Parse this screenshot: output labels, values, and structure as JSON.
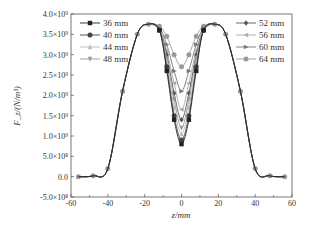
{
  "chart_data": {
    "type": "line",
    "title": "",
    "xlabel": "z/mm",
    "ylabel": "F_z/(N/m³)",
    "xlim": [
      -60,
      60
    ],
    "ylim": [
      -500000000,
      4000000000
    ],
    "grid": false,
    "legend_position": "upper-left and upper-right inside plot",
    "x_ticks": [
      "-60",
      "-40",
      "-20",
      "0",
      "20",
      "40",
      "60"
    ],
    "y_ticks": [
      "-5.0×10⁸",
      "0.0",
      "5.0×10⁸",
      "1.0×10⁹",
      "1.5×10⁹",
      "2.0×10⁹",
      "2.5×10⁹",
      "3.0×10⁹",
      "3.5×10⁹",
      "4.0×10⁹"
    ],
    "x": [
      -56,
      -48,
      -40,
      -32,
      -24,
      -18,
      -12,
      -8,
      -4,
      0,
      4,
      8,
      12,
      18,
      24,
      32,
      40,
      48,
      56
    ],
    "series": [
      {
        "name": "36 mm",
        "marker": "square",
        "color": "#222222",
        "values": [
          0,
          20000000.0,
          200000000.0,
          2100000000.0,
          3500000000.0,
          3750000000.0,
          3600000000.0,
          2600000000.0,
          1400000000.0,
          800000000.0,
          1400000000.0,
          2600000000.0,
          3600000000.0,
          3750000000.0,
          3500000000.0,
          2100000000.0,
          200000000.0,
          20000000.0,
          0
        ]
      },
      {
        "name": "40 mm",
        "marker": "circle",
        "color": "#444444",
        "values": [
          0,
          20000000.0,
          200000000.0,
          2100000000.0,
          3500000000.0,
          3750000000.0,
          3600000000.0,
          2700000000.0,
          1500000000.0,
          900000000.0,
          1500000000.0,
          2700000000.0,
          3600000000.0,
          3750000000.0,
          3500000000.0,
          2100000000.0,
          200000000.0,
          20000000.0,
          0
        ]
      },
      {
        "name": "44 mm",
        "marker": "triangle-up",
        "color": "#bbbbbb",
        "values": [
          0,
          20000000.0,
          200000000.0,
          2100000000.0,
          3500000000.0,
          3750000000.0,
          3600000000.0,
          2800000000.0,
          1700000000.0,
          1050000000.0,
          1700000000.0,
          2800000000.0,
          3600000000.0,
          3750000000.0,
          3500000000.0,
          2100000000.0,
          200000000.0,
          20000000.0,
          0
        ]
      },
      {
        "name": "48 mm",
        "marker": "triangle-down",
        "color": "#999999",
        "values": [
          0,
          20000000.0,
          200000000.0,
          2100000000.0,
          3500000000.0,
          3750000000.0,
          3600000000.0,
          2900000000.0,
          1900000000.0,
          1200000000.0,
          1900000000.0,
          2900000000.0,
          3600000000.0,
          3750000000.0,
          3500000000.0,
          2100000000.0,
          200000000.0,
          20000000.0,
          0
        ]
      },
      {
        "name": "52 mm",
        "marker": "diamond",
        "color": "#555555",
        "values": [
          0,
          20000000.0,
          200000000.0,
          2100000000.0,
          3500000000.0,
          3750000000.0,
          3600000000.0,
          3000000000.0,
          2050000000.0,
          1400000000.0,
          2050000000.0,
          3000000000.0,
          3600000000.0,
          3750000000.0,
          3500000000.0,
          2100000000.0,
          200000000.0,
          20000000.0,
          0
        ]
      },
      {
        "name": "56 mm",
        "marker": "triangle-left",
        "color": "#aaaaaa",
        "values": [
          0,
          20000000.0,
          200000000.0,
          2100000000.0,
          3500000000.0,
          3750000000.0,
          3620000000.0,
          3100000000.0,
          2300000000.0,
          1650000000.0,
          2300000000.0,
          3100000000.0,
          3620000000.0,
          3750000000.0,
          3500000000.0,
          2100000000.0,
          200000000.0,
          20000000.0,
          0
        ]
      },
      {
        "name": "60 mm",
        "marker": "triangle-right",
        "color": "#777777",
        "values": [
          0,
          20000000.0,
          200000000.0,
          2100000000.0,
          3500000000.0,
          3750000000.0,
          3650000000.0,
          3250000000.0,
          2600000000.0,
          2100000000.0,
          2600000000.0,
          3250000000.0,
          3650000000.0,
          3750000000.0,
          3500000000.0,
          2100000000.0,
          200000000.0,
          20000000.0,
          0
        ]
      },
      {
        "name": "64 mm",
        "marker": "hexagon",
        "color": "#999999",
        "values": [
          0,
          20000000.0,
          200000000.0,
          2100000000.0,
          3500000000.0,
          3750000000.0,
          3700000000.0,
          3450000000.0,
          3000000000.0,
          2700000000.0,
          3000000000.0,
          3450000000.0,
          3700000000.0,
          3750000000.0,
          3500000000.0,
          2100000000.0,
          200000000.0,
          20000000.0,
          0
        ]
      }
    ]
  },
  "legend": {
    "left": [
      "36 mm",
      "40 mm",
      "44 mm",
      "48 mm"
    ],
    "right": [
      "52 mm",
      "56 mm",
      "60 mm",
      "64 mm"
    ]
  },
  "axes": {
    "xlabel": "z/mm",
    "ylabel": "F_z/(N/m³)"
  }
}
